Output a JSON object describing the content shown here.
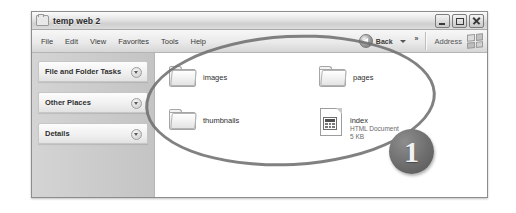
{
  "window": {
    "title": "temp web 2",
    "icon": "folder-icon",
    "controls": {
      "minimize": "Minimize",
      "maximize": "Maximize",
      "close": "Close"
    }
  },
  "menubar": {
    "items": [
      {
        "label": "File"
      },
      {
        "label": "Edit"
      },
      {
        "label": "View"
      },
      {
        "label": "Favorites"
      },
      {
        "label": "Tools"
      },
      {
        "label": "Help"
      }
    ]
  },
  "toolbar": {
    "back_label": "Back",
    "back_icon": "back-arrow-icon",
    "dropdown_icon": "caret-down-icon",
    "overflow_label": "»",
    "address_label": "Address",
    "brand_icon": "windows-flag-icon"
  },
  "sidebar": {
    "panels": [
      {
        "title": "File and Folder Tasks",
        "chevron": "chevron-down-icon"
      },
      {
        "title": "Other Places",
        "chevron": "chevron-down-icon"
      },
      {
        "title": "Details",
        "chevron": "chevron-down-icon"
      }
    ]
  },
  "files": {
    "column_left": [
      {
        "name": "images",
        "type": "folder",
        "subtype": "",
        "size": ""
      },
      {
        "name": "thumbnails",
        "type": "folder",
        "subtype": "",
        "size": ""
      }
    ],
    "column_right": [
      {
        "name": "pages",
        "type": "folder",
        "subtype": "",
        "size": ""
      },
      {
        "name": "index",
        "type": "document",
        "subtype": "HTML Document",
        "size": "5 KB"
      }
    ]
  },
  "annotations": {
    "ellipse": {
      "shape": "ellipse-highlight"
    },
    "callout": {
      "number": "1"
    }
  },
  "colors": {
    "annotation": "#6f6f6f",
    "titlebar": "#e6e6e6",
    "sidebar": "#c9c9c9",
    "content": "#ffffff"
  }
}
